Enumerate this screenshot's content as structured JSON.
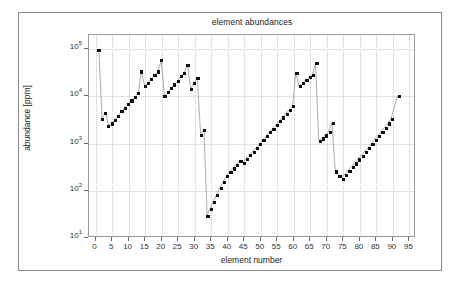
{
  "chart_data": {
    "type": "scatter",
    "title": "element abundances",
    "xlabel": "element number",
    "ylabel": "abundance [ppm]",
    "yscale": "log",
    "xlim": [
      -2,
      97
    ],
    "ylim": [
      10,
      200000
    ],
    "grid": true,
    "legend": null,
    "xticks": [
      0,
      5,
      10,
      15,
      20,
      25,
      30,
      35,
      40,
      45,
      50,
      55,
      60,
      65,
      70,
      75,
      80,
      85,
      90,
      95
    ],
    "ytick_values": [
      10,
      100,
      1000,
      10000,
      100000
    ],
    "ytick_labels": [
      "10 1",
      "10 2",
      "10 3",
      "10 4",
      "10 5"
    ],
    "ytick_mantissa": [
      "10",
      "10",
      "10",
      "10",
      "10"
    ],
    "ytick_exponent": [
      "1",
      "2",
      "3",
      "4",
      "5"
    ],
    "marker": "filled-square",
    "marker_color": "#111111",
    "line_color": "#888888",
    "x": [
      1,
      2,
      3,
      4,
      5,
      6,
      7,
      8,
      9,
      10,
      11,
      12,
      13,
      14,
      15,
      16,
      17,
      18,
      19,
      20,
      21,
      22,
      23,
      24,
      25,
      26,
      27,
      28,
      29,
      30,
      31,
      32,
      33,
      34,
      35,
      36,
      37,
      38,
      39,
      40,
      41,
      42,
      43,
      44,
      45,
      46,
      47,
      48,
      49,
      50,
      51,
      52,
      53,
      54,
      55,
      56,
      57,
      58,
      59,
      60,
      61,
      62,
      63,
      64,
      65,
      66,
      67,
      68,
      69,
      70,
      71,
      72,
      73,
      74,
      75,
      76,
      77,
      78,
      79,
      80,
      81,
      82,
      83,
      84,
      85,
      86,
      87,
      88,
      89,
      90,
      92
    ],
    "y": [
      95000,
      3300,
      4300,
      2300,
      2600,
      3100,
      3800,
      4700,
      5600,
      6700,
      8000,
      9500,
      11500,
      33000,
      16000,
      19000,
      23000,
      28000,
      33000,
      57000,
      9800,
      12000,
      14500,
      17500,
      21000,
      26000,
      31000,
      46000,
      14000,
      19000,
      24000,
      1500,
      1900,
      28,
      40,
      57,
      80,
      110,
      150,
      200,
      240,
      290,
      350,
      420,
      380,
      460,
      550,
      660,
      790,
      950,
      1150,
      1400,
      1700,
      2000,
      2400,
      2900,
      3500,
      4200,
      5000,
      6000,
      31000,
      16000,
      19000,
      22000,
      25000,
      28000,
      50000,
      1100,
      1250,
      1450,
      1700,
      2700,
      250,
      200,
      175,
      215,
      260,
      310,
      370,
      450,
      540,
      650,
      780,
      940,
      1150,
      1400,
      1700,
      2100,
      2600,
      3200,
      10000,
      100
    ]
  },
  "figure": {
    "has_outer_frame": true,
    "background": "#ffffff"
  }
}
